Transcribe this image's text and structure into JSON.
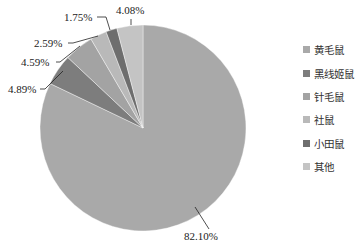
{
  "chart_data": {
    "type": "pie",
    "title": "",
    "categories": [
      "黄毛鼠",
      "黑线姬鼠",
      "针毛鼠",
      "社鼠",
      "小田鼠",
      "其他"
    ],
    "values": [
      82.1,
      4.89,
      4.59,
      2.59,
      1.75,
      4.08
    ],
    "labels": [
      "82.10%",
      "4.89%",
      "4.59%",
      "2.59%",
      "1.75%",
      "4.08%"
    ],
    "colors": [
      "#a9a9a9",
      "#7d7d7d",
      "#a3a3a3",
      "#b9b9b9",
      "#6e6e6e",
      "#c4c4c4"
    ],
    "start_angle": "12 o'clock",
    "direction": "clockwise",
    "legend_position": "right"
  },
  "legend": {
    "items": [
      {
        "label": "黄毛鼠",
        "color": "#a9a9a9"
      },
      {
        "label": "黑线姬鼠",
        "color": "#7d7d7d"
      },
      {
        "label": "针毛鼠",
        "color": "#a3a3a3"
      },
      {
        "label": "社鼠",
        "color": "#b9b9b9"
      },
      {
        "label": "小田鼠",
        "color": "#6e6e6e"
      },
      {
        "label": "其他",
        "color": "#c4c4c4"
      }
    ]
  }
}
